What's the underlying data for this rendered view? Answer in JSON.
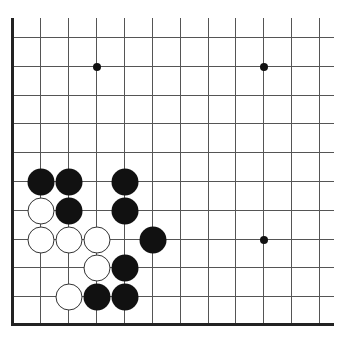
{
  "board": {
    "type": "go-board-fragment",
    "columns_x": [
      12,
      40,
      68,
      96,
      124,
      152,
      180,
      208,
      235,
      263,
      291,
      319
    ],
    "rows_y": [
      37,
      66,
      95,
      123,
      152,
      181,
      210,
      239,
      267,
      296,
      324
    ],
    "line_top": 18,
    "line_right": 334,
    "edges": [
      "left",
      "bottom"
    ],
    "colors": {
      "line": "#555555",
      "edge": "#222222",
      "black": "#111111",
      "white": "#ffffff"
    }
  },
  "hoshi": [
    {
      "col": 3,
      "row": 1
    },
    {
      "col": 9,
      "row": 1
    },
    {
      "col": 9,
      "row": 7
    }
  ],
  "stones": [
    {
      "color": "black",
      "col": 1,
      "row": 5
    },
    {
      "color": "black",
      "col": 2,
      "row": 5
    },
    {
      "color": "black",
      "col": 4,
      "row": 5
    },
    {
      "color": "white",
      "col": 1,
      "row": 6
    },
    {
      "color": "black",
      "col": 2,
      "row": 6
    },
    {
      "color": "black",
      "col": 4,
      "row": 6
    },
    {
      "color": "white",
      "col": 1,
      "row": 7
    },
    {
      "color": "white",
      "col": 2,
      "row": 7
    },
    {
      "color": "white",
      "col": 3,
      "row": 7
    },
    {
      "color": "black",
      "col": 5,
      "row": 7
    },
    {
      "color": "white",
      "col": 3,
      "row": 8
    },
    {
      "color": "black",
      "col": 4,
      "row": 8
    },
    {
      "color": "white",
      "col": 2,
      "row": 9
    },
    {
      "color": "black",
      "col": 3,
      "row": 9
    },
    {
      "color": "black",
      "col": 4,
      "row": 9
    }
  ]
}
